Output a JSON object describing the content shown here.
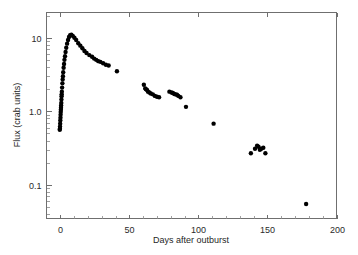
{
  "chart_data": {
    "type": "scatter",
    "title": "",
    "xlabel": "Days after outburst",
    "ylabel": "Flux (crab units)",
    "xscale": "linear",
    "yscale": "log",
    "xlim": [
      -10,
      200
    ],
    "ylim": [
      0.035,
      22
    ],
    "grid": false,
    "legend": null,
    "xticks": [
      0,
      50,
      100,
      150,
      200
    ],
    "xticklabels": [
      "0",
      "50",
      "100",
      "150",
      "200"
    ],
    "yticks": [
      10,
      1.0,
      0.1
    ],
    "yticklabels": [
      "10",
      "1.0",
      "0.1"
    ],
    "yminorticks": [
      0.04,
      0.05,
      0.06,
      0.07,
      0.08,
      0.09,
      0.2,
      0.3,
      0.4,
      0.5,
      0.6,
      0.7,
      0.8,
      0.9,
      2,
      3,
      4,
      5,
      6,
      7,
      8,
      9,
      20
    ],
    "marker": "filled-circle",
    "marker_color": "#000000",
    "marker_size_px": 3.2,
    "series": [
      {
        "name": "X-ray flux",
        "x": [
          -0.4,
          -0.3,
          -0.2,
          -0.1,
          0.0,
          0.1,
          0.2,
          0.3,
          0.4,
          0.5,
          0.6,
          0.7,
          0.8,
          0.9,
          1.0,
          1.1,
          1.3,
          1.5,
          1.7,
          1.9,
          2.1,
          2.4,
          2.7,
          3.0,
          3.4,
          3.8,
          4.3,
          4.9,
          5.6,
          6.3,
          7.1,
          8.0,
          9.0,
          10.2,
          11.5,
          13.0,
          14.5,
          16.0,
          17.5,
          19.0,
          21.0,
          23.0,
          24.5,
          26.0,
          27.5,
          29.0,
          31.0,
          33.0,
          35.0,
          41.0,
          60.5,
          61.5,
          62.0,
          62.8,
          63.5,
          64.5,
          65.5,
          67.0,
          68.5,
          70.0,
          71.5,
          79.0,
          80.5,
          81.5,
          82.5,
          83.5,
          84.5,
          85.5,
          87.0,
          91.0,
          111.0,
          138.0,
          141.0,
          142.5,
          143.5,
          144.5,
          145.5,
          147.0,
          148.5,
          178.0
        ],
        "y": [
          0.56,
          0.58,
          0.62,
          0.68,
          0.75,
          0.82,
          0.9,
          0.98,
          1.05,
          1.12,
          1.2,
          1.3,
          1.45,
          1.6,
          1.7,
          1.85,
          2.1,
          2.4,
          2.7,
          3.0,
          3.4,
          3.9,
          4.4,
          5.0,
          5.6,
          6.4,
          7.3,
          8.3,
          9.3,
          10.2,
          10.8,
          11.0,
          10.6,
          10.0,
          9.3,
          8.4,
          7.8,
          7.2,
          6.6,
          6.2,
          5.8,
          5.5,
          5.2,
          5.0,
          4.8,
          4.7,
          4.5,
          4.3,
          4.2,
          3.5,
          2.3,
          2.05,
          2.0,
          1.95,
          1.85,
          1.8,
          1.75,
          1.7,
          1.62,
          1.58,
          1.55,
          1.85,
          1.8,
          1.78,
          1.72,
          1.7,
          1.68,
          1.62,
          1.55,
          1.15,
          0.68,
          0.27,
          0.31,
          0.34,
          0.33,
          0.3,
          0.31,
          0.32,
          0.27,
          0.055
        ]
      }
    ]
  }
}
